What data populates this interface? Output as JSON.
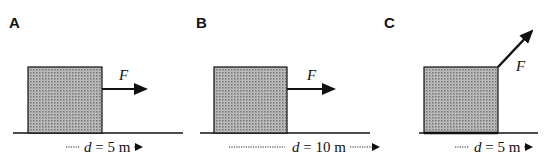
{
  "diagram": {
    "type": "physics-work-comparison",
    "panels": [
      {
        "id": "A",
        "label": "A",
        "force_label": "F",
        "force_direction": "horizontal",
        "distance_var": "d",
        "distance_text": " = 5 m",
        "distance_value": 5,
        "distance_unit": "m"
      },
      {
        "id": "B",
        "label": "B",
        "force_label": "F",
        "force_direction": "horizontal",
        "distance_var": "d",
        "distance_text": " = 10 m",
        "distance_value": 10,
        "distance_unit": "m"
      },
      {
        "id": "C",
        "label": "C",
        "force_label": "F",
        "force_direction": "angled-up-right",
        "distance_var": "d",
        "distance_text": " = 5 m",
        "distance_value": 5,
        "distance_unit": "m"
      }
    ],
    "colors": {
      "ink": "#111111",
      "box_fill": "#b9b9b9",
      "box_dot": "#7a7a7a",
      "background": "#ffffff"
    }
  }
}
